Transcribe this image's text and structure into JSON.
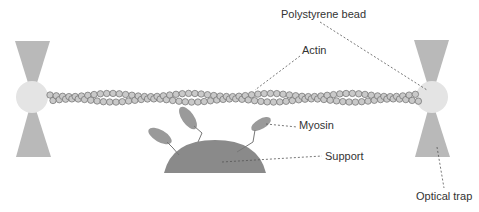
{
  "labels": {
    "bead": "Polystyrene bead",
    "actin": "Actin",
    "myosin": "Myosin",
    "support": "Support",
    "trap": "Optical trap"
  },
  "colors": {
    "cone": "#b9b9b9",
    "bead": "#e4e4e4",
    "actin_fill": "#c9c9c9",
    "actin_stroke": "#6f6f6f",
    "support": "#8a8a8a",
    "myosin": "#9a9a9a",
    "leader": "#555555",
    "text": "#333333"
  }
}
